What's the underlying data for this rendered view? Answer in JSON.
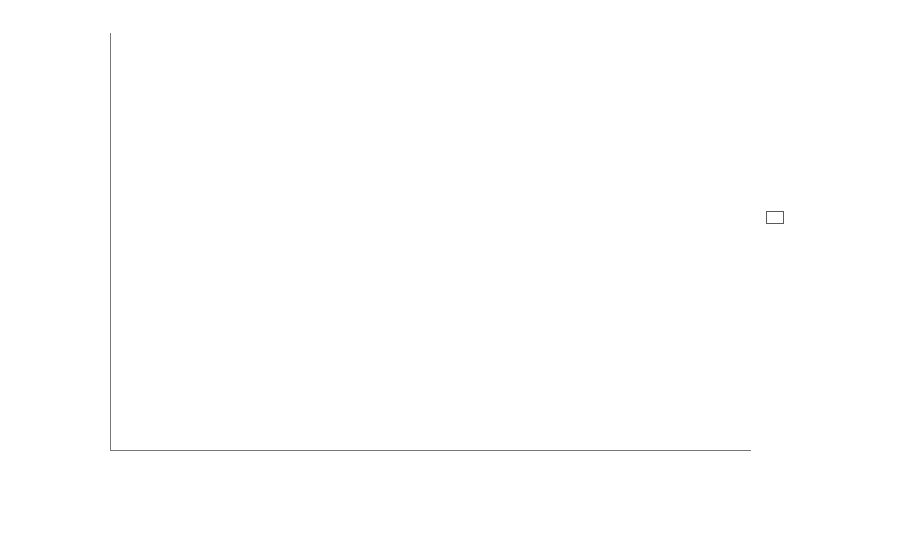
{
  "chart_data": {
    "type": "bar",
    "subtype": "stacked-bar-100",
    "title": "",
    "xlabel": "",
    "ylabel": "Percentage of species",
    "ylim": [
      0,
      100
    ],
    "yticks": [
      0,
      20,
      40,
      60,
      80,
      100
    ],
    "grid": false,
    "legend_position": "right",
    "categories": [
      "Alpine vegetation",
      "Wetland",
      "Meadow",
      "Steppe",
      "Forest",
      "Disturbed sites"
    ],
    "category_lines": [
      [
        "Alpine",
        "vegetation"
      ],
      [
        "Wetland",
        ""
      ],
      [
        "Meadow",
        ""
      ],
      [
        "Steppe",
        ""
      ],
      [
        "Forest",
        ""
      ],
      [
        "Disturbed",
        "sites"
      ]
    ],
    "series": [
      {
        "name": "Clonal",
        "color": "#0b0b0b",
        "style": "filled",
        "values": [
          92.7,
          90.8,
          87.5,
          71.2,
          70.0,
          50.5
        ]
      },
      {
        "name": "Non-clonal",
        "color": "#ffffff",
        "style": "hollow",
        "values": [
          7.3,
          9.2,
          12.5,
          28.8,
          30.0,
          49.5
        ]
      }
    ]
  },
  "legend": {
    "items": [
      {
        "label": "Clonal",
        "swatch": "filled-square"
      },
      {
        "label": "Non-clonal",
        "swatch": "hollow-square"
      }
    ]
  },
  "axis": {
    "y_tick_labels": [
      "0",
      "20",
      "40",
      "60",
      "80",
      "100"
    ]
  }
}
